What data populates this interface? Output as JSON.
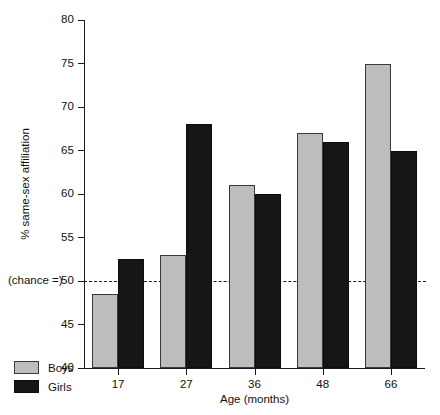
{
  "chart_data": {
    "type": "bar",
    "title": "",
    "xlabel": "Age (months)",
    "ylabel": "% same-sex affiliation",
    "categories": [
      "17",
      "27",
      "36",
      "48",
      "66"
    ],
    "series": [
      {
        "name": "Boys",
        "color": "#bdbdbd",
        "values": [
          48.5,
          53,
          61,
          67,
          75
        ]
      },
      {
        "name": "Girls",
        "color": "#161616",
        "values": [
          52.5,
          68,
          60,
          66,
          65
        ]
      }
    ],
    "ylim": [
      40,
      80
    ],
    "yticks": [
      40,
      45,
      50,
      55,
      60,
      65,
      70,
      75,
      80
    ],
    "ytick_labels": [
      "40",
      "45",
      "50",
      "55",
      "60",
      "65",
      "70",
      "75",
      "80"
    ],
    "grid": false,
    "legend_position": "bottom-left",
    "annotations": [
      {
        "name": "chance-line",
        "text": "(chance =)",
        "value": 50,
        "style": "dashed-horizontal"
      }
    ]
  }
}
